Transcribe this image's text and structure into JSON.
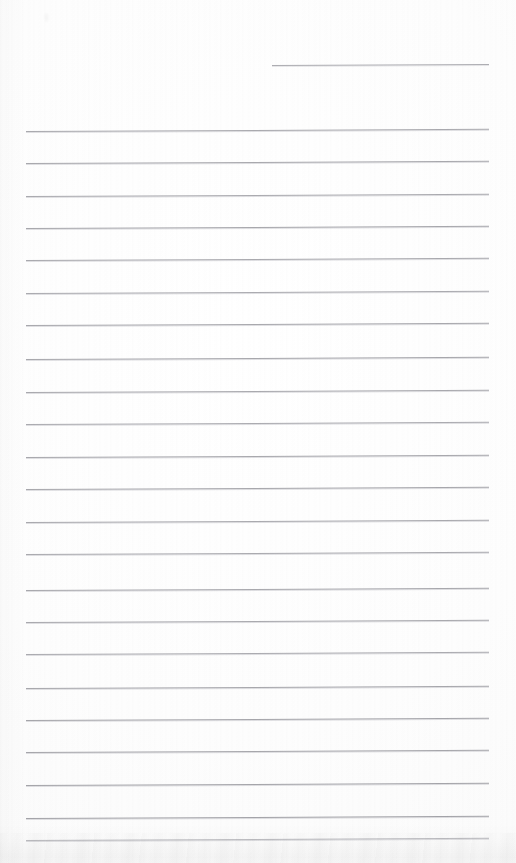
{
  "document": {
    "kind": "scanned-lined-paper",
    "title": "Blank ruled notebook page",
    "width": 516,
    "height": 863,
    "background_color": "#fdfdfd",
    "content_text": "",
    "handwriting_present": "no",
    "printed_text_present": "no"
  },
  "ruling": {
    "line_color": "#a8a8ac",
    "line_thickness_px": 1,
    "line_spacing_px": 32.3,
    "left_margin_x": 26,
    "right_margin_x": 489,
    "full_rule_count": 23,
    "partial_rule_count": 1,
    "first_full_rule_y": 131,
    "last_full_rule_y": 818,
    "tilt_degrees": -0.28
  },
  "partial_rule": {
    "label": "top-short-rule",
    "y": 65,
    "x_start": 272,
    "x_end": 489,
    "color": "#adadb2"
  },
  "rules": [
    {
      "y": 131,
      "x_start": 26,
      "x_end": 489,
      "color": "#a9a9ae"
    },
    {
      "y": 163,
      "x_start": 26,
      "x_end": 489,
      "color": "#a8a8ad"
    },
    {
      "y": 196,
      "x_start": 26,
      "x_end": 489,
      "color": "#aaaaaf"
    },
    {
      "y": 228,
      "x_start": 26,
      "x_end": 489,
      "color": "#a7a7ac"
    },
    {
      "y": 260,
      "x_start": 26,
      "x_end": 489,
      "color": "#a9a9ae"
    },
    {
      "y": 293,
      "x_start": 26,
      "x_end": 489,
      "color": "#ababb0"
    },
    {
      "y": 325,
      "x_start": 26,
      "x_end": 489,
      "color": "#a8a8ad"
    },
    {
      "y": 359,
      "x_start": 26,
      "x_end": 489,
      "color": "#a7a7ac"
    },
    {
      "y": 392,
      "x_start": 26,
      "x_end": 489,
      "color": "#a9a9ae"
    },
    {
      "y": 424,
      "x_start": 26,
      "x_end": 489,
      "color": "#ababb0"
    },
    {
      "y": 457,
      "x_start": 26,
      "x_end": 489,
      "color": "#a8a8ad"
    },
    {
      "y": 489,
      "x_start": 26,
      "x_end": 489,
      "color": "#a7a7ac"
    },
    {
      "y": 522,
      "x_start": 26,
      "x_end": 489,
      "color": "#a9a9ae"
    },
    {
      "y": 554,
      "x_start": 26,
      "x_end": 489,
      "color": "#aaaaaf"
    },
    {
      "y": 590,
      "x_start": 26,
      "x_end": 489,
      "color": "#a8a8ad"
    },
    {
      "y": 622,
      "x_start": 26,
      "x_end": 489,
      "color": "#a9a9ae"
    },
    {
      "y": 654,
      "x_start": 26,
      "x_end": 489,
      "color": "#ababb0"
    },
    {
      "y": 688,
      "x_start": 26,
      "x_end": 489,
      "color": "#a7a7ac"
    },
    {
      "y": 720,
      "x_start": 26,
      "x_end": 489,
      "color": "#a5a5aa"
    },
    {
      "y": 752,
      "x_start": 26,
      "x_end": 489,
      "color": "#a6a6ab"
    },
    {
      "y": 785,
      "x_start": 26,
      "x_end": 489,
      "color": "#a4a4a9"
    },
    {
      "y": 818,
      "x_start": 26,
      "x_end": 489,
      "color": "#a3a3a8"
    },
    {
      "y": 840,
      "x_start": 26,
      "x_end": 489,
      "color": "#bcbcc0"
    }
  ],
  "artifacts": {
    "bottom_shadow": {
      "label": "scan-edge-shadow",
      "y_start": 823,
      "height": 40
    },
    "speck": {
      "label": "dust-speck",
      "x": 45,
      "y": 13
    }
  }
}
